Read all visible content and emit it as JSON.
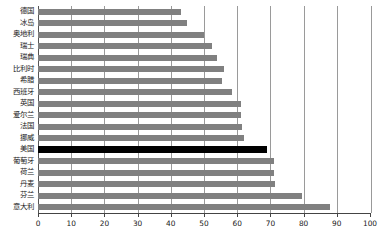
{
  "chart_data": {
    "type": "bar",
    "orientation": "horizontal",
    "title": "",
    "subtitle": "",
    "xlabel": "",
    "ylabel": "",
    "xlim": [
      0,
      100
    ],
    "ylim": null,
    "grid": true,
    "legend": null,
    "xticks": [
      0,
      10,
      20,
      30,
      40,
      50,
      60,
      70,
      80,
      90,
      100
    ],
    "xtick_labels": [
      "0",
      "10",
      "20",
      "30",
      "40",
      "50",
      "60",
      "70",
      "80",
      "90",
      "100"
    ],
    "categories": [
      "德国",
      "冰岛",
      "奥地利",
      "瑞士",
      "瑞典",
      "比利时",
      "希腊",
      "西班牙",
      "英国",
      "爱尔兰",
      "法国",
      "挪威",
      "美国",
      "葡萄牙",
      "荷兰",
      "丹麦",
      "芬兰",
      "意大利"
    ],
    "values": [
      43,
      45,
      50,
      52.5,
      54,
      56,
      55.5,
      58.5,
      61,
      61,
      61.5,
      62,
      69,
      71,
      71,
      71.5,
      79.5,
      88
    ],
    "highlight_category": "美国",
    "colors": {
      "bar": "#808080",
      "highlight_bar": "#000000",
      "gridline": "#9a9a9a",
      "axis": "#444444",
      "background": "#ffffff",
      "text": "#1a1a1a"
    }
  }
}
